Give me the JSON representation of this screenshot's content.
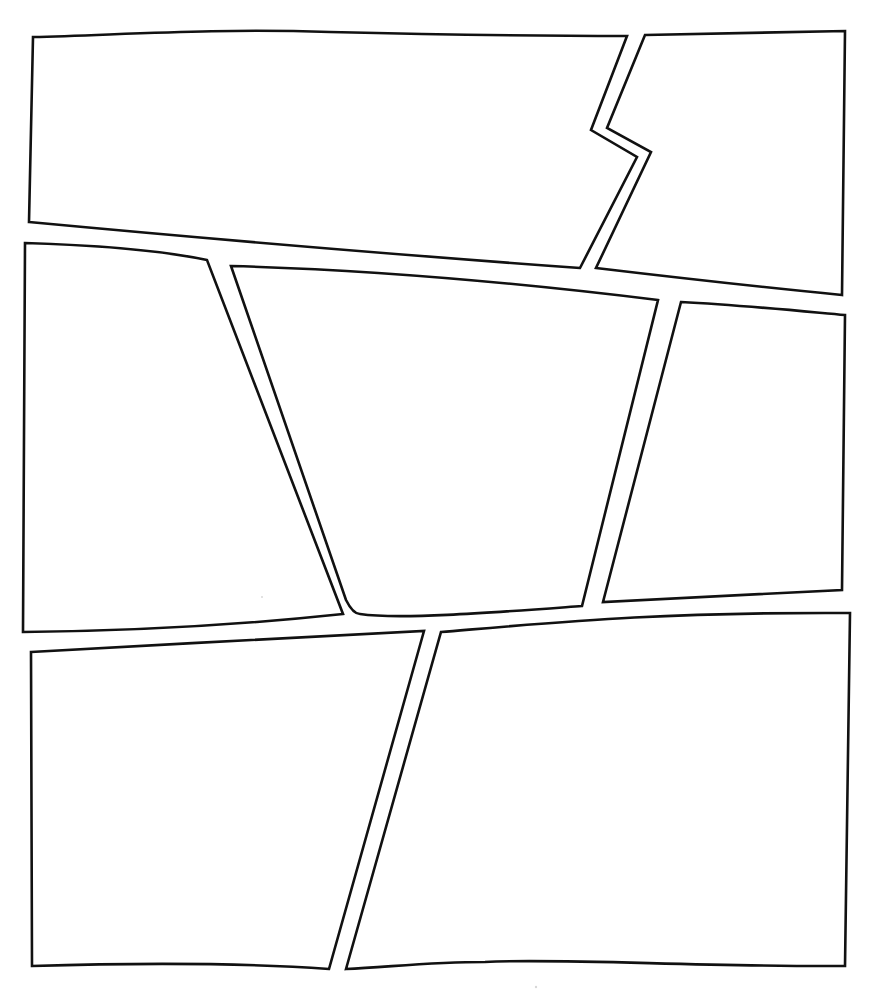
{
  "page": {
    "type": "comic-panel-layout-template",
    "background": "#ffffff",
    "border_color": "#111111",
    "panel_count": 7,
    "rows": [
      {
        "name": "top-row",
        "panels": [
          "panel-1",
          "panel-2"
        ]
      },
      {
        "name": "middle-row",
        "panels": [
          "panel-3",
          "panel-4",
          "panel-5"
        ]
      },
      {
        "name": "bottom-row",
        "panels": [
          "panel-6",
          "panel-7"
        ]
      }
    ],
    "panels": [
      {
        "id": "panel-1",
        "row": "top",
        "position": "left",
        "content": ""
      },
      {
        "id": "panel-2",
        "row": "top",
        "position": "right",
        "content": ""
      },
      {
        "id": "panel-3",
        "row": "middle",
        "position": "left",
        "content": ""
      },
      {
        "id": "panel-4",
        "row": "middle",
        "position": "center",
        "content": ""
      },
      {
        "id": "panel-5",
        "row": "middle",
        "position": "right",
        "content": ""
      },
      {
        "id": "panel-6",
        "row": "bottom",
        "position": "left",
        "content": ""
      },
      {
        "id": "panel-7",
        "row": "bottom",
        "position": "right",
        "content": ""
      }
    ]
  }
}
